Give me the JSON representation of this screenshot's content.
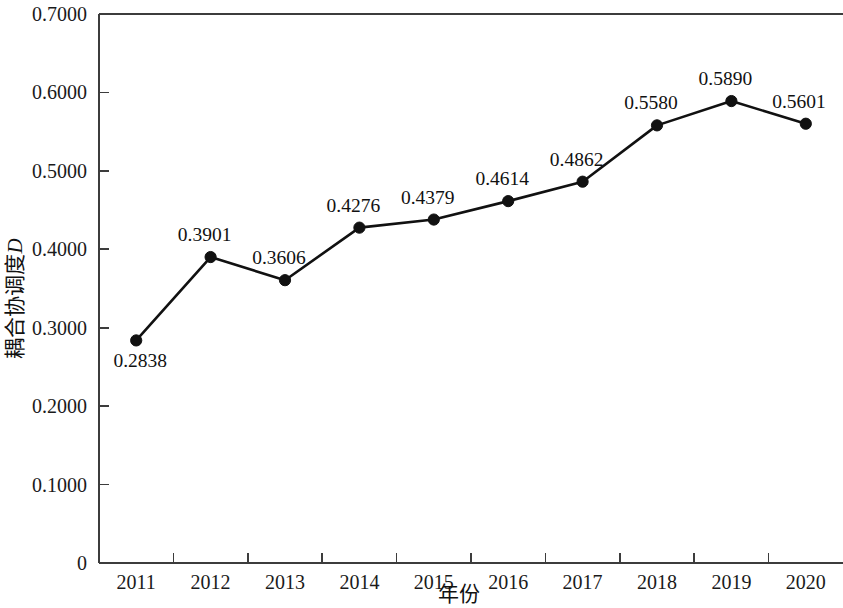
{
  "chart_data": {
    "type": "line",
    "title": "",
    "xlabel": "年份",
    "ylabel": "耦合协调度",
    "ylabel_italic_suffix": "D",
    "categories": [
      "2011",
      "2012",
      "2013",
      "2014",
      "2015",
      "2016",
      "2017",
      "2018",
      "2019",
      "2020"
    ],
    "values": [
      0.2838,
      0.3901,
      0.3606,
      0.4276,
      0.4379,
      0.4614,
      0.4862,
      0.558,
      0.589,
      0.5601
    ],
    "point_labels": [
      "0.2838",
      "0.3901",
      "0.3606",
      "0.4276",
      "0.4379",
      "0.4614",
      "0.4862",
      "0.5580",
      "0.5890",
      "0.5601"
    ],
    "point_label_positions": [
      "below",
      "above",
      "above",
      "above",
      "above",
      "above",
      "above",
      "above",
      "above",
      "above"
    ],
    "ylim": [
      0,
      0.7
    ],
    "yticks": [
      0,
      0.1,
      0.2,
      0.3,
      0.4,
      0.5,
      0.6,
      0.7
    ],
    "ytick_labels": [
      "0",
      "0.1000",
      "0.2000",
      "0.3000",
      "0.4000",
      "0.5000",
      "0.6000",
      "0.7000"
    ],
    "grid": false,
    "legend": "none",
    "series_color": "#111111",
    "axis_color": "#3c3c3c",
    "background_color": "#ffffff",
    "marker": "filled-circle"
  }
}
